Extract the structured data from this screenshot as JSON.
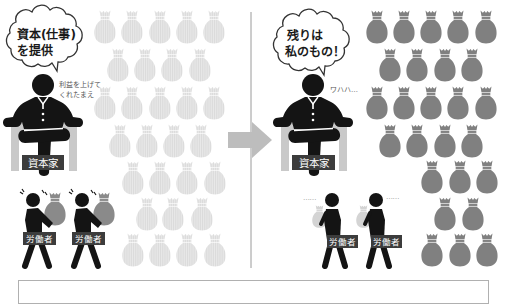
{
  "illustration": {
    "before": {
      "capitalist": {
        "speech": [
          "資本(仕事)",
          "を提供"
        ],
        "remark": [
          "利益を上げて",
          "くれたまえ"
        ],
        "label": "資本家"
      },
      "workers": [
        {
          "label": "労働者",
          "carrying": "heavy-money-bag"
        },
        {
          "label": "労働者",
          "carrying": "heavy-money-bag"
        }
      ],
      "money_bags": {
        "style": "faded",
        "count": 29,
        "rows": [
          {
            "y": 10,
            "x": [
              105,
              132,
              160,
              187,
              214
            ]
          },
          {
            "y": 48,
            "x": [
              118,
              145,
              172,
              200
            ]
          },
          {
            "y": 86,
            "x": [
              105,
              132,
              160,
              187,
              214
            ]
          },
          {
            "y": 124,
            "x": [
              120,
              147,
              174,
              201
            ]
          },
          {
            "y": 161,
            "x": [
              133,
              160,
              187,
              215
            ]
          },
          {
            "y": 197,
            "x": [
              147,
              173,
              202
            ]
          },
          {
            "y": 233,
            "x": [
              133,
              160,
              187,
              215
            ]
          }
        ]
      }
    },
    "after": {
      "capitalist": {
        "speech": [
          "残りは",
          "私のもの！"
        ],
        "remark": [
          "ワハハ…"
        ],
        "label": "資本家"
      },
      "workers": [
        {
          "label": "労働者",
          "carrying": "small-money-bag",
          "trail": "……"
        },
        {
          "label": "労働者",
          "carrying": "small-money-bag",
          "trail": "……"
        }
      ],
      "money_bags": {
        "style": "solid",
        "count": 26,
        "rows": [
          {
            "y": 10,
            "x": [
              377,
              404,
              431,
              458,
              486
            ]
          },
          {
            "y": 48,
            "x": [
              390,
              417,
              445,
              472
            ]
          },
          {
            "y": 86,
            "x": [
              377,
              404,
              431,
              458,
              486
            ]
          },
          {
            "y": 124,
            "x": [
              390,
              417,
              445,
              472
            ]
          },
          {
            "y": 160,
            "x": [
              432,
              460,
              487
            ]
          },
          {
            "y": 197,
            "x": [
              445,
              473
            ]
          },
          {
            "y": 233,
            "x": [
              432,
              460,
              487
            ]
          }
        ]
      }
    },
    "transition_arrow": {
      "direction": "right"
    }
  },
  "colors": {
    "figure": "#141414",
    "chair": "#c9c9c9",
    "label_bg": "#3c3c3c",
    "bag_solid": "#808080",
    "bag_faded": "#e6e6e6",
    "bag_heavy_carried": "#8a8a8a",
    "bag_small_carried": "#d4d4d4",
    "arrow": "#bdbdbd",
    "divider": "#9a9a9a"
  }
}
